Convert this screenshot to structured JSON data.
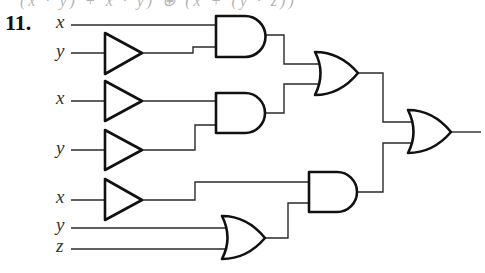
{
  "header": {
    "clipped_text": "(x · y) + x · y) ⊕ (x + (y · z))",
    "problem_number": "11."
  },
  "inputs": [
    {
      "id": "in1",
      "label": "x",
      "y": 25
    },
    {
      "id": "in2",
      "label": "y",
      "y": 53
    },
    {
      "id": "in3",
      "label": "x",
      "y": 101
    },
    {
      "id": "in4",
      "label": "y",
      "y": 150
    },
    {
      "id": "in5",
      "label": "x",
      "y": 200
    },
    {
      "id": "in6",
      "label": "y",
      "y": 228
    },
    {
      "id": "in7",
      "label": "z",
      "y": 249
    }
  ],
  "gates": [
    {
      "id": "inv1",
      "type": "inverter",
      "input": "y"
    },
    {
      "id": "inv2",
      "type": "inverter",
      "input": "x"
    },
    {
      "id": "inv3",
      "type": "inverter",
      "input": "y"
    },
    {
      "id": "inv4",
      "type": "inverter",
      "input": "x"
    },
    {
      "id": "and1",
      "type": "AND",
      "inputs": [
        "x",
        "inv1"
      ]
    },
    {
      "id": "and2",
      "type": "AND",
      "inputs": [
        "inv2",
        "inv3"
      ]
    },
    {
      "id": "or1",
      "type": "OR",
      "inputs": [
        "and1",
        "and2"
      ]
    },
    {
      "id": "or2",
      "type": "OR",
      "inputs": [
        "y",
        "z"
      ]
    },
    {
      "id": "and3",
      "type": "AND",
      "inputs": [
        "inv4",
        "or2"
      ]
    },
    {
      "id": "or3",
      "type": "OR",
      "inputs": [
        "or1",
        "and3"
      ],
      "output": true
    }
  ],
  "colors": {
    "line": "#111111",
    "background": "#ffffff",
    "label": "#333333"
  }
}
